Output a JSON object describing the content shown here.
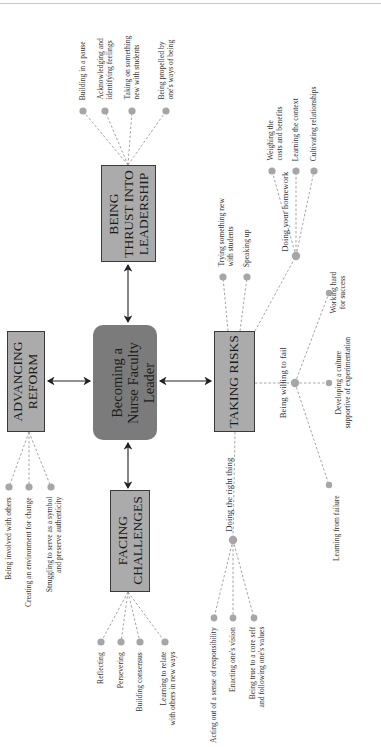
{
  "center": {
    "label": "Becoming a\nNurse Faculty\nLeader",
    "color": "#7b7b7b"
  },
  "themes": {
    "thrust": {
      "label": "BEING\nTHRUST INTO\nLEADERSHIP",
      "children": [
        "Building in a pause",
        "Acknowledging and\nidentifying feelings",
        "Taking on something\nnew with students",
        "Being propelled by\none's ways of being"
      ]
    },
    "reform": {
      "label": "ADVANCING\nREFORM",
      "children": [
        "Being involved with others",
        "Creating an environment for change",
        "Struggling to serve as a symbol\nand preserve authenticity"
      ]
    },
    "challenges": {
      "label": "FACING\nCHALLENGES",
      "children": [
        "Reflecting",
        "Persevering",
        "Building consensus",
        "Learning to relate\nwith others in new ways"
      ]
    },
    "risks": {
      "label": "TAKING RISKS",
      "direct_children": [
        "Trying something new\nwith students",
        "Speaking up"
      ],
      "homework": {
        "label": "Doing your homework",
        "children": [
          "Weighing the\ncosts and benefits",
          "Learning the context",
          "Cultivating relationships"
        ]
      },
      "fail": {
        "label": "Being willing to fail",
        "children": [
          "Working hard\nfor success",
          "Developing a culture\nsupportive of experimentation",
          "Learning from failure"
        ]
      },
      "right": {
        "label": "Doing the right thing",
        "children": [
          "Acting out of a sense of responsibility",
          "Enacting one's vision",
          "Being true to a core self\nand following one's values"
        ]
      }
    }
  },
  "colors": {
    "theme_box": "#ababab",
    "node": "#a6a6a6",
    "dash": "#9a9a9a",
    "arrow": "#222222"
  }
}
